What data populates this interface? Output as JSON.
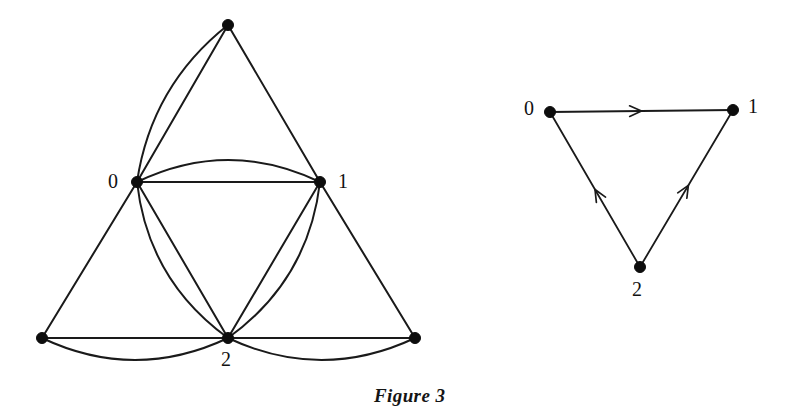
{
  "figure": {
    "caption": "Figure 3",
    "caption_position": {
      "x": 374,
      "y": 385
    },
    "background_color": "#ffffff",
    "ink_color": "#1a1a1a"
  },
  "left_diagram": {
    "name": "multigraph-sierpinski-triangle",
    "type": "undirected-multigraph",
    "vertices": [
      {
        "id": "apex",
        "label": "",
        "x": 228,
        "y": 25,
        "r": 5.5,
        "label_x": 0,
        "label_y": 0
      },
      {
        "id": "v0",
        "label": "0",
        "x": 137,
        "y": 182,
        "r": 5.5,
        "label_x": 108,
        "label_y": 171
      },
      {
        "id": "v1",
        "label": "1",
        "x": 320,
        "y": 182,
        "r": 5.5,
        "label_x": 338,
        "label_y": 171
      },
      {
        "id": "v2",
        "label": "2",
        "x": 228,
        "y": 338,
        "r": 5.5,
        "label_x": 221,
        "label_y": 349
      },
      {
        "id": "bottom_left",
        "label": "",
        "x": 42,
        "y": 338,
        "r": 5.5,
        "label_x": 0,
        "label_y": 0
      },
      {
        "id": "bottom_right",
        "label": "",
        "x": 415,
        "y": 338,
        "r": 5.5,
        "label_x": 0,
        "label_y": 0
      }
    ],
    "edges": [
      {
        "from": "apex",
        "to": "v0",
        "shape": "straight",
        "bow": 0
      },
      {
        "from": "apex",
        "to": "v0",
        "shape": "curved",
        "bow": 18
      },
      {
        "from": "apex",
        "to": "v1",
        "shape": "straight",
        "bow": 0
      },
      {
        "from": "v0",
        "to": "v1",
        "shape": "straight",
        "bow": 0
      },
      {
        "from": "v0",
        "to": "v1",
        "shape": "curved",
        "bow": 22
      },
      {
        "from": "v0",
        "to": "v2",
        "shape": "straight",
        "bow": 0
      },
      {
        "from": "v0",
        "to": "v2",
        "shape": "curved",
        "bow": 20
      },
      {
        "from": "v1",
        "to": "v2",
        "shape": "straight",
        "bow": 0
      },
      {
        "from": "v1",
        "to": "v2",
        "shape": "curved",
        "bow": 20
      },
      {
        "from": "v0",
        "to": "bottom_left",
        "shape": "straight",
        "bow": 0
      },
      {
        "from": "v1",
        "to": "bottom_right",
        "shape": "straight",
        "bow": 0
      },
      {
        "from": "bottom_left",
        "to": "v2",
        "shape": "straight",
        "bow": 0
      },
      {
        "from": "bottom_left",
        "to": "v2",
        "shape": "curved",
        "bow": 22
      },
      {
        "from": "v2",
        "to": "bottom_right",
        "shape": "straight",
        "bow": 0
      },
      {
        "from": "v2",
        "to": "bottom_right",
        "shape": "curved",
        "bow": 22
      }
    ]
  },
  "right_diagram": {
    "name": "directed-triangle",
    "type": "directed-graph",
    "vertices": [
      {
        "id": "d0",
        "label": "0",
        "x": 550,
        "y": 112,
        "r": 5.5,
        "label_x": 524,
        "label_y": 98
      },
      {
        "id": "d1",
        "label": "1",
        "x": 733,
        "y": 110,
        "r": 5.5,
        "label_x": 748,
        "label_y": 96
      },
      {
        "id": "d2",
        "label": "2",
        "x": 640,
        "y": 267,
        "r": 5.5,
        "label_x": 632,
        "label_y": 279
      }
    ],
    "edges": [
      {
        "from": "d0",
        "to": "d1",
        "directed": true,
        "arrow_at": 0.5
      },
      {
        "from": "d2",
        "to": "d0",
        "directed": true,
        "arrow_at": 0.5
      },
      {
        "from": "d2",
        "to": "d1",
        "directed": true,
        "arrow_at": 0.52
      }
    ]
  }
}
